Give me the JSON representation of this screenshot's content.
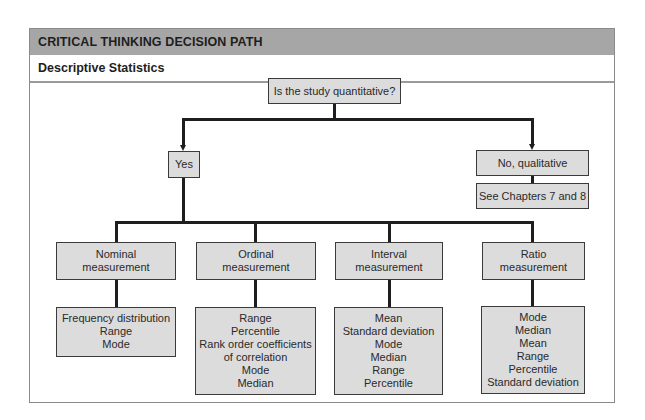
{
  "header": {
    "title": "CRITICAL THINKING DECISION PATH",
    "subtitle": "Descriptive Statistics"
  },
  "colors": {
    "header_band": "#a6a6a6",
    "box_fill": "#dcdcdc",
    "line": "#1e1e1e"
  },
  "diagram": {
    "root": {
      "label": "Is the study quantitative?"
    },
    "yes": {
      "label": "Yes"
    },
    "no": {
      "label": "No, qualitative",
      "next": "See Chapters 7 and 8"
    },
    "measurements": [
      {
        "label_line1": "Nominal",
        "label_line2": "measurement",
        "statistics": [
          "Frequency distribution",
          "Range",
          "Mode"
        ]
      },
      {
        "label_line1": "Ordinal",
        "label_line2": "measurement",
        "statistics": [
          "Range",
          "Percentile",
          "Rank order coefficients",
          "of correlation",
          "Mode",
          "Median"
        ]
      },
      {
        "label_line1": "Interval",
        "label_line2": "measurement",
        "statistics": [
          "Mean",
          "Standard deviation",
          "Mode",
          "Median",
          "Range",
          "Percentile"
        ]
      },
      {
        "label_line1": "Ratio",
        "label_line2": "measurement",
        "statistics": [
          "Mode",
          "Median",
          "Mean",
          "Range",
          "Percentile",
          "Standard deviation"
        ]
      }
    ]
  }
}
